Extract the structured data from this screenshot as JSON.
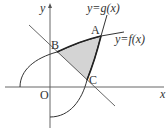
{
  "diagram": {
    "axes": {
      "x_label": "x",
      "y_label": "y",
      "origin_label": "O"
    },
    "curves": {
      "f_label": "y=f(x)",
      "g_label": "y=g(x)"
    },
    "points": {
      "A": "A",
      "B": "B",
      "C": "C"
    },
    "shaded_region": "triangle-like region bounded by segment BC (line), arc BA of y=f(x), and arc AC of y=g(x)",
    "colors": {
      "stroke": "#333333",
      "shade": "#d4d4d4"
    }
  }
}
